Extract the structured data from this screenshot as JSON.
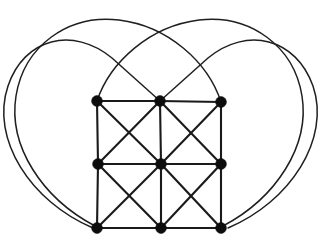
{
  "figure": {
    "background_color": "#ffffff",
    "width": 325,
    "height": 244
  },
  "style": {
    "vertex_color": "#0d0d0d",
    "vertex_radius": 5.4,
    "straight_edge_color": "#1a1a1a",
    "straight_edge_width": 2.1,
    "curved_edge_color": "#1f1f1f",
    "curved_edge_width": 1.5
  },
  "graph": {
    "vertex_count": 9,
    "vertices": [
      {
        "id": "n00",
        "label": "top-left",
        "row": 0,
        "col": 0,
        "x": 97,
        "y": 101
      },
      {
        "id": "n01",
        "label": "top-middle",
        "row": 0,
        "col": 1,
        "x": 160,
        "y": 101
      },
      {
        "id": "n02",
        "label": "top-right",
        "row": 0,
        "col": 2,
        "x": 221,
        "y": 102
      },
      {
        "id": "n10",
        "label": "middle-left",
        "row": 1,
        "col": 0,
        "x": 98,
        "y": 164
      },
      {
        "id": "n11",
        "label": "center",
        "row": 1,
        "col": 1,
        "x": 161,
        "y": 164
      },
      {
        "id": "n12",
        "label": "middle-right",
        "row": 1,
        "col": 2,
        "x": 221,
        "y": 164
      },
      {
        "id": "n20",
        "label": "bottom-left",
        "row": 2,
        "col": 0,
        "x": 97,
        "y": 228
      },
      {
        "id": "n21",
        "label": "bottom-middle",
        "row": 2,
        "col": 1,
        "x": 161,
        "y": 228
      },
      {
        "id": "n22",
        "label": "bottom-right",
        "row": 2,
        "col": 2,
        "x": 221,
        "y": 228
      }
    ],
    "horizontal_edges": [
      {
        "from": "n00",
        "to": "n01",
        "path": "M 97 101 L 160 101"
      },
      {
        "from": "n01",
        "to": "n02",
        "path": "M 160 101 L 221 102"
      },
      {
        "from": "n10",
        "to": "n11",
        "path": "M 98 164 L 161 164"
      },
      {
        "from": "n11",
        "to": "n12",
        "path": "M 161 164 L 221 164"
      },
      {
        "from": "n20",
        "to": "n21",
        "path": "M 97 228 L 161 228"
      },
      {
        "from": "n21",
        "to": "n22",
        "path": "M 161 228 L 221 228"
      }
    ],
    "vertical_edges": [
      {
        "from": "n00",
        "to": "n10",
        "path": "M 97 101 L 98 164"
      },
      {
        "from": "n10",
        "to": "n20",
        "path": "M 98 164 L 97 228"
      },
      {
        "from": "n01",
        "to": "n11",
        "path": "M 160 101 L 161 164"
      },
      {
        "from": "n11",
        "to": "n21",
        "path": "M 161 164 L 161 228"
      },
      {
        "from": "n02",
        "to": "n12",
        "path": "M 221 102 L 221 164"
      },
      {
        "from": "n12",
        "to": "n22",
        "path": "M 221 164 L 221 228"
      }
    ],
    "diagonal_edges": [
      {
        "from": "n00",
        "to": "n11",
        "path": "M 97 101 L 161 164"
      },
      {
        "from": "n01",
        "to": "n10",
        "path": "M 160 101 L 98 164"
      },
      {
        "from": "n01",
        "to": "n12",
        "path": "M 160 101 L 221 164"
      },
      {
        "from": "n02",
        "to": "n11",
        "path": "M 221 102 L 161 164"
      },
      {
        "from": "n10",
        "to": "n21",
        "path": "M 98 164 L 161 228"
      },
      {
        "from": "n11",
        "to": "n20",
        "path": "M 161 164 L 97 228"
      },
      {
        "from": "n11",
        "to": "n22",
        "path": "M 161 164 L 221 228"
      },
      {
        "from": "n12",
        "to": "n21",
        "path": "M 221 164 L 161 228"
      }
    ],
    "wrap_edges": [
      {
        "id": "wrap-tm-to-bl",
        "from": "n01",
        "to": "n20",
        "note": "straight segment up-right from top-middle, then long arc sweeping over the right lobe and down the far right side to bottom-left",
        "path": "M 160 101 L 208 58 C 247 26 296 38 313 86 C 331 139 290 202 228 228"
      },
      {
        "id": "wrap-tm-to-br",
        "from": "n01",
        "to": "n22",
        "note": "straight segment up-left from top-middle, then long arc sweeping over the left lobe and down the far left side to bottom-right",
        "path": "M 160 101 L 112 58 C 73 26 24 38 8 86 C -10 139 31 202 93 228"
      },
      {
        "id": "wrap-tl-to-br",
        "from": "n00",
        "to": "n22",
        "note": "arc rising from top-left vertex across the upper area toward the right lobe and down to the bottom-right vertex",
        "path": "M 97 101 C 110 62 150 26 199 20 C 250 14 294 46 302 96 C 310 146 276 198 223 226"
      },
      {
        "id": "wrap-tr-to-bl",
        "from": "n02",
        "to": "n20",
        "note": "arc rising from top-right vertex across the upper area toward the left lobe and down to the bottom-left vertex",
        "path": "M 221 102 C 208 62 168 26 119 20 C 68 14 24 46 16 96 C 8 146 42 198 95 226"
      }
    ]
  }
}
